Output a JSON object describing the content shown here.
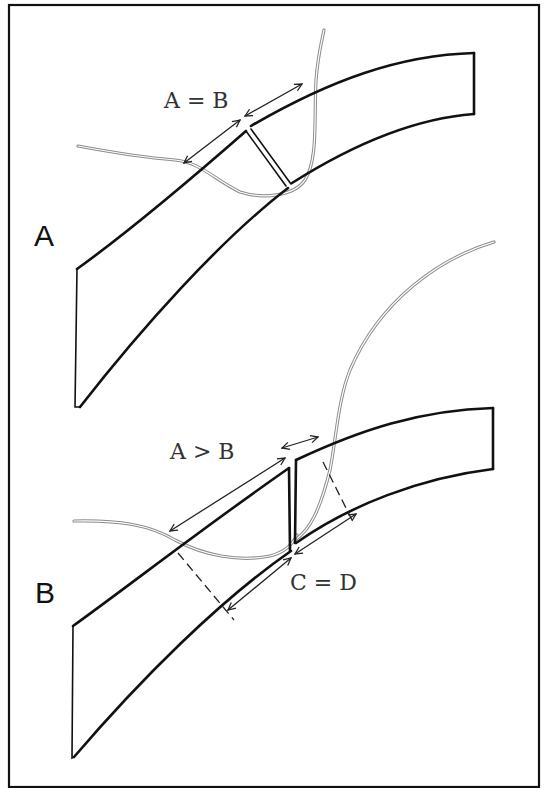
{
  "figure": {
    "panels": [
      {
        "id": "A",
        "label": "A",
        "relation_label": "A = B",
        "description": "Bent strip cut by a fracture perpendicular to the layer; arc lengths on either side are equal"
      },
      {
        "id": "B",
        "label": "B",
        "relation_label_top": "A > B",
        "relation_label_bottom": "C = D",
        "description": "Bent strip with a vertical fracture offset; outer arcs unequal (A > B) while inner arcs equal (C = D)"
      }
    ],
    "colors": {
      "line": "#111111",
      "contour": "#8c8c8c",
      "background": "#ffffff"
    }
  }
}
